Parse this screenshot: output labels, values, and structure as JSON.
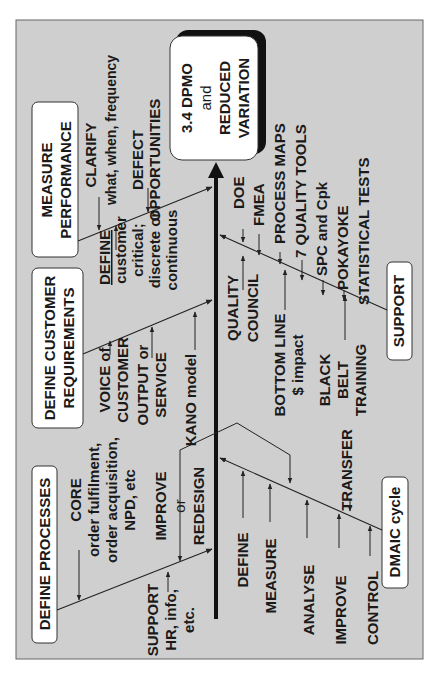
{
  "diagram": {
    "type": "fishbone",
    "orientation": "rotated-90-ccw",
    "colors": {
      "panel": "#cfcfcf",
      "box": "#ffffff",
      "ink": "#1a1a1a"
    },
    "effect": {
      "line1": "3.4 DPMO",
      "line2": "and",
      "line3": "REDUCED",
      "line4": "VARIATION"
    },
    "categories": {
      "measure": {
        "title1": "MEASURE",
        "title2": "PERFORMANCE",
        "items": {
          "clarify1": "CLARIFY",
          "clarify2": "what, when, frequency",
          "defect1": "DEFECT",
          "defect2": "OPPORTUNITIES",
          "define1": "DEFINE",
          "define2": "customer",
          "define3": "critical;",
          "define4": "discrete or",
          "define5": "continuous"
        }
      },
      "customer": {
        "title1": "DEFINE CUSTOMER",
        "title2": "REQUIREMENTS",
        "items": {
          "voice1": "VOICE of",
          "voice2": "CUSTOMER",
          "output1": "OUTPUT or",
          "output2": "SERVICE",
          "kano": "KANO model"
        }
      },
      "processes": {
        "title": "DEFINE PROCESSES",
        "items": {
          "core1": "CORE",
          "core2": "order fulfilment,",
          "core3": "order acquisition,",
          "core4": "NPD, etc",
          "improve1": "IMPROVE",
          "improve2": "or",
          "improve3": "REDESIGN",
          "support1": "SUPPORT",
          "support2": "HR, info,",
          "support3": "etc."
        }
      },
      "support": {
        "title": "SUPPORT",
        "items": {
          "doe": "DOE",
          "fmea": "FMEA",
          "pmaps": "PROCESS MAPS",
          "qtools": "7 QUALITY TOOLS",
          "spc": "SPC and Cpk",
          "poka": "POKAYOKE",
          "stats": "STATISTICAL TESTS",
          "qc1": "QUALITY",
          "qc2": "COUNCIL",
          "bl1": "BOTTOM LINE",
          "bl2": "$ impact",
          "bb1": "BLACK",
          "bb2": "BELT",
          "bb3": "TRAINING"
        }
      },
      "dmaic": {
        "title": "DMAIC cycle",
        "items": {
          "define": "DEFINE",
          "measure": "MEASURE",
          "analyse": "ANALYSE",
          "improve": "IMPROVE",
          "control": "CONTROL",
          "transfer": "TRANSFER"
        }
      }
    }
  }
}
